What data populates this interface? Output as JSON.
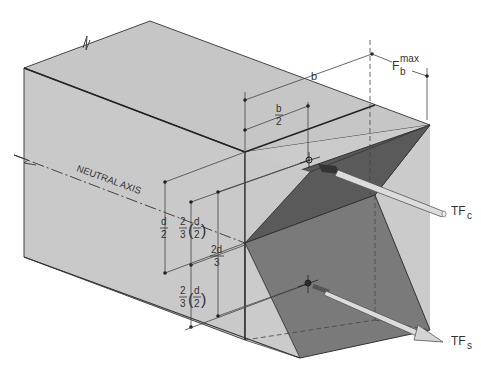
{
  "diagram": {
    "labels": {
      "neutral_axis": "NEUTRAL AXIS",
      "b": "b",
      "b_half_num": "b",
      "b_half_den": "2",
      "fb": "F",
      "fb_sup": "max",
      "fb_sub": "b",
      "d_half_num": "d",
      "d_half_den": "2",
      "two_thirds_num": "2",
      "two_thirds_den": "3",
      "paren_d_num": "d",
      "paren_d_den": "2",
      "two_d_num": "2d",
      "two_d_den": "3",
      "two_thirds2_num": "2",
      "two_thirds2_den": "3",
      "paren_d2_num": "d",
      "paren_d2_den": "2",
      "tfc": "TF",
      "tfc_sub": "c",
      "tfs": "TF",
      "tfs_sub": "s"
    },
    "colors": {
      "beam_face": "#c8c8c8",
      "beam_top": "#c4c4c4",
      "stress_dark": "#5a5a5a",
      "stress_mid": "#7a7a7a",
      "line": "#333333"
    }
  }
}
